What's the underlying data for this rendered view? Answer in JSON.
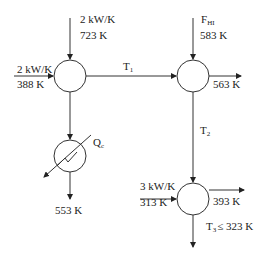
{
  "diagram": {
    "type": "heat-exchanger-network",
    "mixer1": {
      "top_inlet": {
        "flow": "2 kW/K",
        "temp": "723 K"
      },
      "left_inlet": {
        "flow": "2 kW/K",
        "temp": "388 K"
      }
    },
    "link_T1": {
      "label": "T",
      "sub": "1"
    },
    "mixer2": {
      "top_inlet": {
        "label": "F",
        "sub": "HI",
        "temp": "583 K"
      },
      "right_outlet": {
        "temp": "563 K"
      }
    },
    "link_T2": {
      "label": "T",
      "sub": "2"
    },
    "cooler": {
      "duty": {
        "label": "Q",
        "sub": "c"
      },
      "outlet": {
        "temp": "553 K"
      }
    },
    "exchanger3": {
      "left_inlet": {
        "flow": "3 kW/K",
        "temp": "313 K"
      },
      "right_outlet": {
        "temp": "393 K"
      },
      "bottom_outlet": {
        "label": "T",
        "sub": "3",
        "constraint": "≤  323 K"
      }
    }
  }
}
